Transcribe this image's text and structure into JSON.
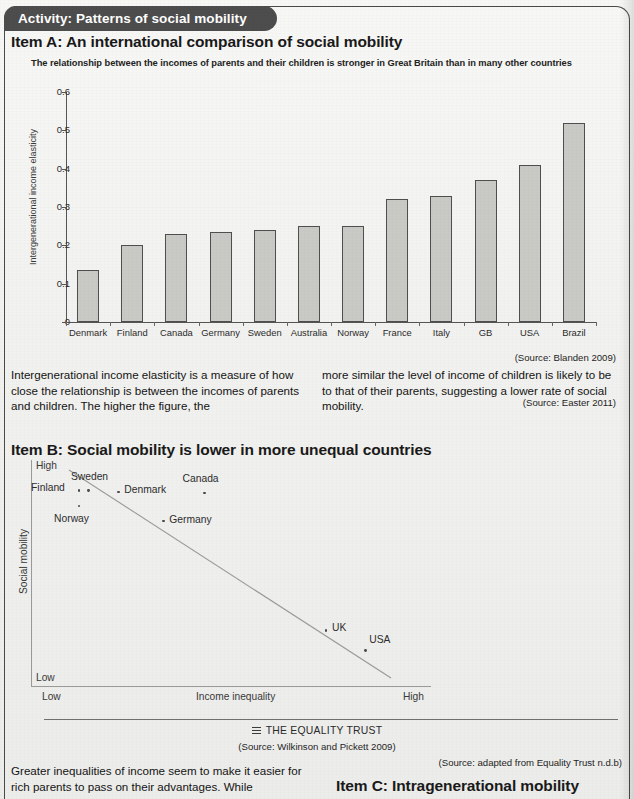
{
  "activity": {
    "tab_label": "Activity: Patterns of social mobility"
  },
  "itemA": {
    "heading": "Item A: An international comparison of social mobility",
    "subtitle": "The relationship between the incomes of parents and their children is stronger in Great Britain than in many other countries",
    "source": "(Source: Blanden 2009)",
    "paragraph_left": "Intergenerational income elasticity is a measure of how close the relationship is between the incomes of parents and children. The higher the figure, the",
    "paragraph_right": "more similar the level of income of children is likely to be to that of their parents, suggesting a lower rate of social mobility.",
    "source_text": "(Source: Easter 2011)"
  },
  "itemB": {
    "heading": "Item B: Social mobility is lower in more unequal countries",
    "ylabel": "Social mobility",
    "xlabel": "Income inequality",
    "y_high": "High",
    "y_low": "Low",
    "x_low": "Low",
    "x_high": "High",
    "logo_text": "THE EQUALITY TRUST",
    "logo_icon": "equality-trust-bars-icon",
    "source": "(Source: Wilkinson and Pickett 2009)",
    "source_equality": "(Source: adapted from Equality Trust n.d.b)"
  },
  "itemC": {
    "heading": "Item C: Intragenerational mobility",
    "paragraph_left": "Greater inequalities of income seem to make it easier for rich parents to pass on their advantages. While"
  },
  "chart_data": [
    {
      "type": "bar",
      "title": "The relationship between the incomes of parents and their children is stronger in Great Britain than in many other countries",
      "xlabel": "",
      "ylabel": "Intergenerational income elasticity",
      "ylim": [
        0,
        0.6
      ],
      "yticks": [
        "0",
        "0.1",
        "0.2",
        "0.3",
        "0.4",
        "0.5",
        "0.6"
      ],
      "ytick_values": [
        0,
        0.1,
        0.2,
        0.3,
        0.4,
        0.5,
        0.6
      ],
      "grid": false,
      "legend": "none",
      "bar_color": "#c9c9c6",
      "bar_edge_color": "#4f4f4f",
      "categories": [
        "Denmark",
        "Finland",
        "Canada",
        "Germany",
        "Sweden",
        "Australia",
        "Norway",
        "France",
        "Italy",
        "GB",
        "USA",
        "Brazil"
      ],
      "values": [
        0.135,
        0.2,
        0.23,
        0.235,
        0.24,
        0.25,
        0.25,
        0.32,
        0.33,
        0.37,
        0.41,
        0.52
      ]
    },
    {
      "type": "scatter",
      "title": "Social mobility is lower in more unequal countries",
      "xlabel": "Income inequality",
      "ylabel": "Social mobility",
      "xlim_labels": [
        "Low",
        "High"
      ],
      "ylim_labels": [
        "Low",
        "High"
      ],
      "grid": false,
      "trendline": true,
      "trendline_color": "#9a9a9a",
      "points": [
        {
          "label": "Finland",
          "x": 0.115,
          "y": 0.885
        },
        {
          "label": "Sweden",
          "x": 0.14,
          "y": 0.885
        },
        {
          "label": "Denmark",
          "x": 0.215,
          "y": 0.88
        },
        {
          "label": "Norway",
          "x": 0.115,
          "y": 0.815
        },
        {
          "label": "Canada",
          "x": 0.435,
          "y": 0.875
        },
        {
          "label": "Germany",
          "x": 0.33,
          "y": 0.745
        },
        {
          "label": "UK",
          "x": 0.745,
          "y": 0.24
        },
        {
          "label": "USA",
          "x": 0.845,
          "y": 0.145
        }
      ]
    }
  ]
}
